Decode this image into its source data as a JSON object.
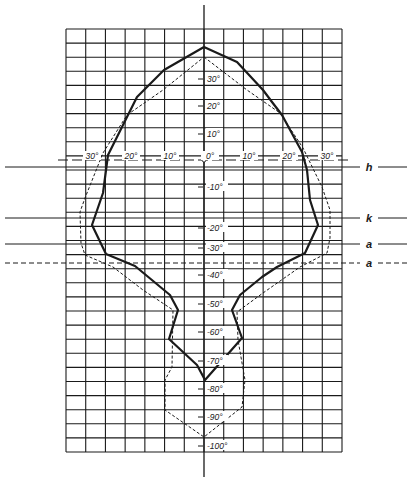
{
  "diagram": {
    "type": "visual-field-plot",
    "grid": {
      "left": 66,
      "right": 342,
      "top": 29,
      "bottom": 452,
      "cols": 14,
      "rows": 30,
      "line_color": "#1a1a1a"
    },
    "axis_center_x": 204,
    "vertical_axis": {
      "x": 204,
      "y_top": 5,
      "y_bottom": 477
    },
    "horizontal_axis_y": 160,
    "horizontal_tick_labels": [
      {
        "text": "30°",
        "x": 92
      },
      {
        "text": "20°",
        "x": 131
      },
      {
        "text": "10°",
        "x": 170
      },
      {
        "text": "0°",
        "x": 210
      },
      {
        "text": "10°",
        "x": 249
      },
      {
        "text": "20°",
        "x": 289
      },
      {
        "text": "30°",
        "x": 327
      }
    ],
    "vertical_tick_labels": [
      {
        "text": "30°",
        "y": 82
      },
      {
        "text": "20°",
        "y": 109
      },
      {
        "text": "10°",
        "y": 137
      },
      {
        "text": "-10°",
        "y": 190
      },
      {
        "text": "-20°",
        "y": 231
      },
      {
        "text": "-30°",
        "y": 251
      },
      {
        "text": "-40°",
        "y": 278
      },
      {
        "text": "-50°",
        "y": 307
      },
      {
        "text": "-60°",
        "y": 335
      },
      {
        "text": "-70°",
        "y": 364
      },
      {
        "text": "-80°",
        "y": 392
      },
      {
        "text": "-90°",
        "y": 420
      },
      {
        "text": "-100°",
        "y": 449
      }
    ],
    "reference_lines": [
      {
        "label": "h",
        "y": 167,
        "style": "solid"
      },
      {
        "label": "k",
        "y": 218,
        "style": "solid"
      },
      {
        "label": "a",
        "y": 244,
        "style": "solid"
      },
      {
        "label": "a",
        "y": 263,
        "style": "dashed"
      }
    ],
    "curves": {
      "solid": {
        "name": "solid-field-boundary",
        "points": [
          [
            204,
            47
          ],
          [
            237,
            62
          ],
          [
            263,
            90
          ],
          [
            272,
            102
          ],
          [
            282,
            115
          ],
          [
            302,
            152
          ],
          [
            307,
            170
          ],
          [
            310,
            200
          ],
          [
            318,
            225
          ],
          [
            305,
            253
          ],
          [
            277,
            267
          ],
          [
            262,
            277
          ],
          [
            240,
            295
          ],
          [
            232,
            310
          ],
          [
            242,
            338
          ],
          [
            220,
            363
          ],
          [
            205,
            380
          ],
          [
            197,
            365
          ],
          [
            169,
            339
          ],
          [
            178,
            310
          ],
          [
            170,
            295
          ],
          [
            135,
            266
          ],
          [
            106,
            254
          ],
          [
            92,
            225
          ],
          [
            103,
            193
          ],
          [
            108,
            155
          ],
          [
            128,
            115
          ],
          [
            137,
            97
          ],
          [
            164,
            70
          ],
          [
            204,
            47
          ]
        ]
      },
      "dashed": {
        "name": "dashed-field-boundary",
        "points": [
          [
            204,
            57
          ],
          [
            247,
            90
          ],
          [
            280,
            113
          ],
          [
            303,
            148
          ],
          [
            322,
            187
          ],
          [
            330,
            210
          ],
          [
            330,
            238
          ],
          [
            327,
            253
          ],
          [
            300,
            267
          ],
          [
            263,
            293
          ],
          [
            237,
            312
          ],
          [
            238,
            340
          ],
          [
            245,
            380
          ],
          [
            242,
            407
          ],
          [
            204,
            437
          ],
          [
            165,
            410
          ],
          [
            165,
            380
          ],
          [
            172,
            367
          ],
          [
            173,
            310
          ],
          [
            143,
            290
          ],
          [
            113,
            267
          ],
          [
            85,
            255
          ],
          [
            81,
            243
          ],
          [
            80,
            212
          ],
          [
            85,
            198
          ],
          [
            103,
            153
          ],
          [
            127,
            115
          ],
          [
            163,
            90
          ],
          [
            204,
            57
          ]
        ]
      }
    },
    "colors": {
      "ink": "#1a1a1a",
      "background": "#ffffff"
    }
  }
}
